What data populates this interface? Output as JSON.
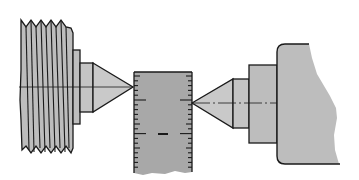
{
  "figure": {
    "title": "Work piece measured between two centers with a graduated scale",
    "colors": {
      "background": "#ffffff",
      "fill": "#bdbdbd",
      "scale_fill": "#a8a8a8",
      "stroke": "#1a1a1a"
    },
    "components": [
      {
        "id": "left-threaded-spindle",
        "label": "Threaded spindle (left)"
      },
      {
        "id": "left-center",
        "label": "Left center point"
      },
      {
        "id": "graduated-scale",
        "label": "Graduated scale"
      },
      {
        "id": "right-center",
        "label": "Right center point"
      },
      {
        "id": "right-tailstock",
        "label": "Tailstock body (right)"
      }
    ],
    "scale": {
      "minor_ticks": 20,
      "major_tick_rows": 2
    }
  }
}
